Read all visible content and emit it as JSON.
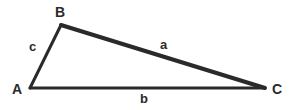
{
  "figure": {
    "kind": "triangle-diagram",
    "background_color": "#ffffff",
    "stroke_color": "#2a2a2a",
    "label_color": "#2a2a2a",
    "canvas": {
      "width": 290,
      "height": 110
    }
  },
  "vertices": [
    {
      "id": "A",
      "label": "A",
      "x": 30,
      "y": 88,
      "label_x": 12,
      "label_y": 82
    },
    {
      "id": "B",
      "label": "B",
      "x": 61,
      "y": 25,
      "label_x": 55,
      "label_y": 5
    },
    {
      "id": "C",
      "label": "C",
      "x": 265,
      "y": 88,
      "label_x": 272,
      "label_y": 82
    }
  ],
  "sides": [
    {
      "id": "a",
      "label": "a",
      "from": "B",
      "to": "C",
      "label_x": 160,
      "label_y": 38,
      "stroke_width": 4
    },
    {
      "id": "b",
      "label": "b",
      "from": "A",
      "to": "C",
      "label_x": 140,
      "label_y": 92,
      "stroke_width": 3
    },
    {
      "id": "c",
      "label": "c",
      "from": "A",
      "to": "B",
      "label_x": 29,
      "label_y": 40,
      "stroke_width": 3
    }
  ],
  "path": {
    "outline": "M 30 88 L 61 25 L 265 88 Z"
  }
}
